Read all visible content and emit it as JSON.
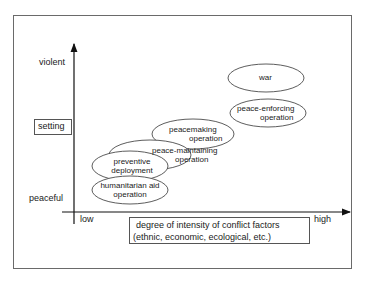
{
  "y_axis": {
    "top_label": "violent",
    "bottom_label": "peaceful",
    "title": "setting"
  },
  "x_axis": {
    "left_label": "low",
    "right_label": "high",
    "title_line1": "degree of intensity of conflict factors",
    "title_line2": "(ethnic, economic, ecological, etc.)"
  },
  "nodes": [
    {
      "id": "humanitarian",
      "line1": "humanitarian aid",
      "line2": "operation"
    },
    {
      "id": "preventive",
      "line1": "preventive",
      "line2": "deployment"
    },
    {
      "id": "peace-maintaining",
      "line1": "peace-maintaining",
      "line2": "operation"
    },
    {
      "id": "peacemaking",
      "line1": "peacemaking",
      "line2": "operation"
    },
    {
      "id": "peace-enforcing",
      "line1": "peace-enforcing",
      "line2": "operation"
    },
    {
      "id": "war",
      "line1": "war",
      "line2": ""
    }
  ]
}
